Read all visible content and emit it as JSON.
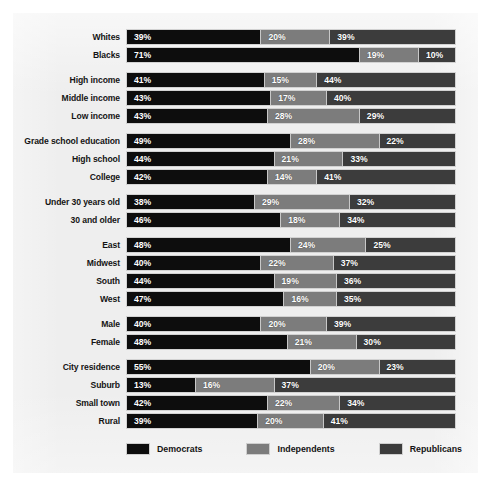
{
  "chart_data": {
    "type": "bar",
    "subtype": "stacked-horizontal-100",
    "title": "",
    "xlabel": "",
    "ylabel": "",
    "xlim": [
      0,
      100
    ],
    "grid": false,
    "legend_position": "bottom",
    "series": [
      {
        "name": "Democrats",
        "color": "#0d0d0d"
      },
      {
        "name": "Independents",
        "color": "#7c7c7c"
      },
      {
        "name": "Republicans",
        "color": "#3c3c3c"
      }
    ],
    "groups": [
      {
        "rows": [
          {
            "category": "Whites",
            "labels": [
              "39%",
              "20%",
              "39%"
            ],
            "values": [
              39,
              20,
              39
            ],
            "widths": [
              41,
              21,
              38
            ]
          },
          {
            "category": "Blacks",
            "labels": [
              "71%",
              "19%",
              "10%"
            ],
            "values": [
              71,
              19,
              10
            ],
            "widths": [
              71,
              18,
              11
            ]
          }
        ]
      },
      {
        "rows": [
          {
            "category": "High income",
            "labels": [
              "41%",
              "15%",
              "44%"
            ],
            "values": [
              41,
              15,
              44
            ],
            "widths": [
              42,
              16,
              42
            ]
          },
          {
            "category": "Middle income",
            "labels": [
              "43%",
              "17%",
              "40%"
            ],
            "values": [
              43,
              17,
              40
            ],
            "widths": [
              44,
              17,
              39
            ]
          },
          {
            "category": "Low income",
            "labels": [
              "43%",
              "28%",
              "29%"
            ],
            "values": [
              43,
              28,
              29
            ],
            "widths": [
              43,
              28,
              29
            ]
          }
        ]
      },
      {
        "rows": [
          {
            "category": "Grade school education",
            "labels": [
              "49%",
              "28%",
              "22%"
            ],
            "values": [
              49,
              28,
              22
            ],
            "widths": [
              50,
              27,
              23
            ]
          },
          {
            "category": "High school",
            "labels": [
              "44%",
              "21%",
              "33%"
            ],
            "values": [
              44,
              21,
              33
            ],
            "widths": [
              45,
              21,
              34
            ]
          },
          {
            "category": "College",
            "labels": [
              "42%",
              "14%",
              "41%"
            ],
            "values": [
              42,
              14,
              41
            ],
            "widths": [
              43,
              15,
              42
            ]
          }
        ]
      },
      {
        "rows": [
          {
            "category": "Under 30 years old",
            "labels": [
              "38%",
              "29%",
              "32%"
            ],
            "values": [
              38,
              29,
              32
            ],
            "widths": [
              39,
              29,
              32
            ]
          },
          {
            "category": "30 and older",
            "labels": [
              "46%",
              "18%",
              "34%"
            ],
            "values": [
              46,
              18,
              34
            ],
            "widths": [
              47,
              18,
              35
            ]
          }
        ]
      },
      {
        "rows": [
          {
            "category": "East",
            "labels": [
              "48%",
              "24%",
              "25%"
            ],
            "values": [
              48,
              24,
              25
            ],
            "widths": [
              50,
              23,
              27
            ]
          },
          {
            "category": "Midwest",
            "labels": [
              "40%",
              "22%",
              "37%"
            ],
            "values": [
              40,
              22,
              37
            ],
            "widths": [
              41,
              22,
              37
            ]
          },
          {
            "category": "South",
            "labels": [
              "44%",
              "19%",
              "36%"
            ],
            "values": [
              44,
              19,
              36
            ],
            "widths": [
              45,
              19,
              36
            ]
          },
          {
            "category": "West",
            "labels": [
              "47%",
              "16%",
              "35%"
            ],
            "values": [
              47,
              16,
              35
            ],
            "widths": [
              48,
              16,
              36
            ]
          }
        ]
      },
      {
        "rows": [
          {
            "category": "Male",
            "labels": [
              "40%",
              "20%",
              "39%"
            ],
            "values": [
              40,
              20,
              39
            ],
            "widths": [
              41,
              20,
              39
            ]
          },
          {
            "category": "Female",
            "labels": [
              "48%",
              "21%",
              "30%"
            ],
            "values": [
              48,
              21,
              30
            ],
            "widths": [
              49,
              21,
              30
            ]
          }
        ]
      },
      {
        "rows": [
          {
            "category": "City residence",
            "labels": [
              "55%",
              "20%",
              "23%"
            ],
            "values": [
              55,
              20,
              23
            ],
            "widths": [
              56,
              21,
              23
            ]
          },
          {
            "category": "Suburb",
            "labels": [
              "13%",
              "16%",
              "37%"
            ],
            "values": [
              13,
              16,
              37
            ],
            "widths": [
              21,
              24,
              55
            ]
          },
          {
            "category": "Small town",
            "labels": [
              "42%",
              "22%",
              "34%"
            ],
            "values": [
              42,
              22,
              34
            ],
            "widths": [
              43,
              22,
              35
            ]
          },
          {
            "category": "Rural",
            "labels": [
              "39%",
              "20%",
              "41%"
            ],
            "values": [
              39,
              20,
              41
            ],
            "widths": [
              40,
              20,
              40
            ]
          }
        ]
      }
    ],
    "legend": [
      {
        "label": "Democrats",
        "color": "#0d0d0d"
      },
      {
        "label": "Independents",
        "color": "#7c7c7c"
      },
      {
        "label": "Republicans",
        "color": "#3c3c3c"
      }
    ]
  }
}
